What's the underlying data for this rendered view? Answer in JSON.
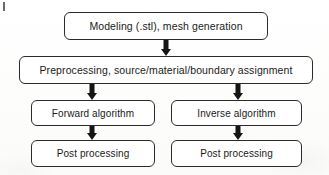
{
  "diagram": {
    "type": "flowchart",
    "orientation": "top-to-bottom",
    "nodes": [
      {
        "id": "modeling",
        "label": "Modeling (.stl), mesh generation",
        "shape": "rounded-rectangle",
        "row": 1,
        "column": "center"
      },
      {
        "id": "preprocessing",
        "label": "Preprocessing, source/material/boundary assignment",
        "shape": "rounded-rectangle",
        "row": 2,
        "column": "center"
      },
      {
        "id": "forward_algorithm",
        "label": "Forward algorithm",
        "shape": "rounded-rectangle",
        "row": 3,
        "column": "left"
      },
      {
        "id": "inverse_algorithm",
        "label": "Inverse algorithm",
        "shape": "rounded-rectangle",
        "row": 3,
        "column": "right"
      },
      {
        "id": "post_processing_left",
        "label": "Post processing",
        "shape": "rounded-rectangle",
        "row": 4,
        "column": "left"
      },
      {
        "id": "post_processing_right",
        "label": "Post processing",
        "shape": "rounded-rectangle",
        "row": 4,
        "column": "right"
      }
    ],
    "edges": [
      {
        "id": "modeling-to-preprocessing",
        "from": "modeling",
        "to": "preprocessing",
        "style": "thick-solid-arrow",
        "direction": "down"
      },
      {
        "id": "preprocessing-to-forward",
        "from": "preprocessing",
        "to": "forward_algorithm",
        "style": "thick-solid-arrow",
        "direction": "down"
      },
      {
        "id": "preprocessing-to-inverse",
        "from": "preprocessing",
        "to": "inverse_algorithm",
        "style": "thick-solid-arrow",
        "direction": "down"
      },
      {
        "id": "forward-to-post",
        "from": "forward_algorithm",
        "to": "post_processing_left",
        "style": "thick-solid-arrow",
        "direction": "down"
      },
      {
        "id": "inverse-to-post",
        "from": "inverse_algorithm",
        "to": "post_processing_right",
        "style": "thick-solid-arrow",
        "direction": "down"
      }
    ],
    "colors": {
      "node_border": "#2b2b2b",
      "node_fill": "#ffffff",
      "text": "#1a1a1a",
      "arrow": "#151515",
      "background": "#fdfdfc"
    }
  }
}
